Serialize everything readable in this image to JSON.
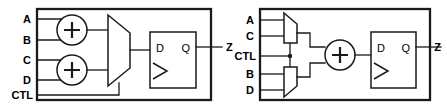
{
  "figure": {
    "type": "digital-logic-schematic",
    "panel_count": 2,
    "line_color": "#1a1a1a",
    "background_color": "#ffffff"
  },
  "panels": [
    {
      "id": "left",
      "name": "adders-then-mux",
      "inputs": [
        {
          "label": "A"
        },
        {
          "label": "B"
        },
        {
          "label": "C"
        },
        {
          "label": "D"
        },
        {
          "label": "CTL"
        }
      ],
      "outputs": [
        {
          "label": "Z"
        }
      ],
      "components": [
        {
          "kind": "adder",
          "symbol": "+",
          "name": "adder-top"
        },
        {
          "kind": "adder",
          "symbol": "+",
          "name": "adder-bottom"
        },
        {
          "kind": "mux",
          "name": "mux"
        },
        {
          "kind": "flipflop",
          "name": "d-flip-flop",
          "pins": {
            "d": "D",
            "q": "Q"
          }
        }
      ]
    },
    {
      "id": "right",
      "name": "muxes-then-adder",
      "inputs": [
        {
          "label": "A"
        },
        {
          "label": "C"
        },
        {
          "label": "CTL"
        },
        {
          "label": "B"
        },
        {
          "label": "D"
        }
      ],
      "outputs": [
        {
          "label": "Z"
        }
      ],
      "components": [
        {
          "kind": "mux",
          "name": "mux-top"
        },
        {
          "kind": "mux",
          "name": "mux-bottom"
        },
        {
          "kind": "adder",
          "symbol": "+",
          "name": "adder"
        },
        {
          "kind": "flipflop",
          "name": "d-flip-flop",
          "pins": {
            "d": "D",
            "q": "Q"
          }
        }
      ]
    }
  ]
}
